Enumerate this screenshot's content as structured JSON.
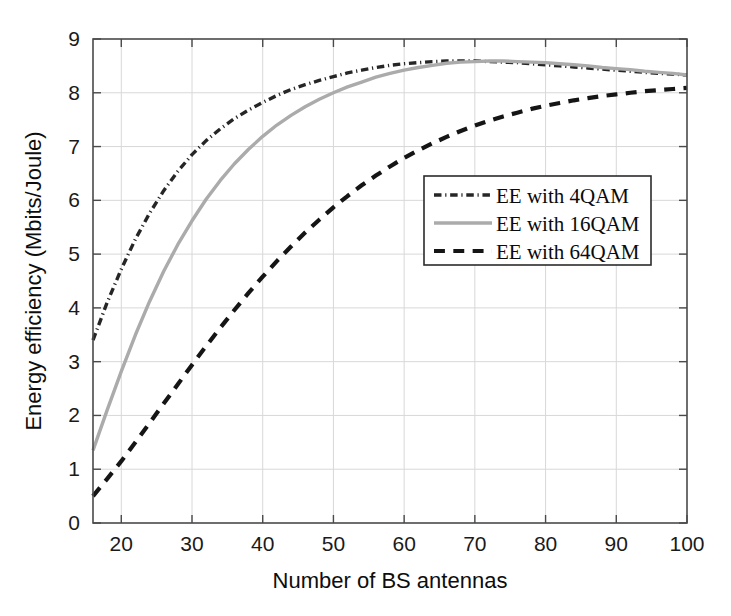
{
  "figure": {
    "background_color": "#ffffff",
    "plot_area": {
      "left": 93,
      "top": 39,
      "right": 687,
      "bottom": 523
    }
  },
  "chart_data": {
    "type": "line",
    "title": "",
    "xlabel": "Number of BS antennas",
    "ylabel": "Energy efficiency (Mbits/Joule)",
    "xlim": [
      16,
      100
    ],
    "ylim": [
      0,
      9
    ],
    "xticks": [
      20,
      30,
      40,
      50,
      60,
      70,
      80,
      90,
      100
    ],
    "xtick_labels": [
      "20",
      "30",
      "40",
      "50",
      "60",
      "70",
      "80",
      "90",
      "100"
    ],
    "yticks": [
      0,
      1,
      2,
      3,
      4,
      5,
      6,
      7,
      8,
      9
    ],
    "ytick_labels": [
      "0",
      "1",
      "2",
      "3",
      "4",
      "5",
      "6",
      "7",
      "8",
      "9"
    ],
    "grid": true,
    "grid_color": "#d8d8d8",
    "legend_position": "center-right",
    "x": [
      16,
      18,
      20,
      22,
      24,
      26,
      28,
      30,
      32,
      34,
      36,
      38,
      40,
      42,
      44,
      46,
      48,
      50,
      52,
      54,
      56,
      58,
      60,
      62,
      64,
      66,
      68,
      70,
      72,
      74,
      76,
      78,
      80,
      82,
      84,
      86,
      88,
      90,
      92,
      94,
      96,
      98,
      100
    ],
    "series": [
      {
        "name": "EE with 4QAM",
        "color": "#262626",
        "linestyle": "dashdot",
        "linewidth": 3.4,
        "values": [
          3.4,
          4.1,
          4.72,
          5.28,
          5.76,
          6.18,
          6.54,
          6.85,
          7.11,
          7.33,
          7.52,
          7.68,
          7.82,
          7.95,
          8.06,
          8.15,
          8.23,
          8.3,
          8.37,
          8.42,
          8.47,
          8.51,
          8.54,
          8.56,
          8.58,
          8.59,
          8.59,
          8.59,
          8.58,
          8.57,
          8.56,
          8.54,
          8.52,
          8.5,
          8.48,
          8.46,
          8.44,
          8.42,
          8.4,
          8.38,
          8.36,
          8.35,
          8.33
        ]
      },
      {
        "name": "EE with 16QAM",
        "color": "#ababab",
        "linestyle": "solid",
        "linewidth": 3.4,
        "values": [
          1.35,
          2.1,
          2.82,
          3.5,
          4.12,
          4.68,
          5.18,
          5.62,
          6.02,
          6.37,
          6.68,
          6.95,
          7.19,
          7.4,
          7.58,
          7.74,
          7.88,
          8.0,
          8.11,
          8.2,
          8.29,
          8.36,
          8.42,
          8.47,
          8.51,
          8.55,
          8.57,
          8.58,
          8.59,
          8.59,
          8.58,
          8.57,
          8.56,
          8.54,
          8.52,
          8.5,
          8.47,
          8.45,
          8.43,
          8.4,
          8.38,
          8.36,
          8.33
        ]
      },
      {
        "name": "EE with 64QAM",
        "color": "#151515",
        "linestyle": "dashed",
        "linewidth": 4.2,
        "values": [
          0.5,
          0.82,
          1.15,
          1.5,
          1.86,
          2.22,
          2.58,
          2.94,
          3.29,
          3.63,
          3.96,
          4.28,
          4.58,
          4.87,
          5.14,
          5.4,
          5.64,
          5.87,
          6.08,
          6.28,
          6.46,
          6.63,
          6.79,
          6.93,
          7.06,
          7.18,
          7.29,
          7.39,
          7.48,
          7.56,
          7.63,
          7.7,
          7.76,
          7.81,
          7.86,
          7.9,
          7.94,
          7.97,
          8.0,
          8.03,
          8.05,
          8.07,
          8.09
        ]
      }
    ]
  },
  "legend": {
    "entries": [
      {
        "label": "EE with 4QAM"
      },
      {
        "label": "EE with 16QAM"
      },
      {
        "label": "EE with 64QAM"
      }
    ]
  }
}
